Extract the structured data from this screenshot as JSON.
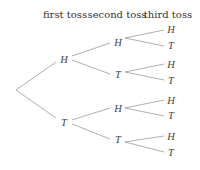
{
  "headers": {
    "first": "first toss",
    "second": "second toss",
    "third": "third toss"
  },
  "tree": {
    "level1": [
      {
        "label": "H"
      },
      {
        "label": "T"
      }
    ],
    "level2": [
      {
        "label": "H"
      },
      {
        "label": "T"
      },
      {
        "label": "H"
      },
      {
        "label": "T"
      }
    ],
    "level3": [
      {
        "label": "H"
      },
      {
        "label": "T"
      },
      {
        "label": "H"
      },
      {
        "label": "T"
      },
      {
        "label": "H"
      },
      {
        "label": "T"
      },
      {
        "label": "H"
      },
      {
        "label": "T"
      }
    ]
  },
  "colors": {
    "edge": "#9a9a9a",
    "text": "#444444"
  }
}
